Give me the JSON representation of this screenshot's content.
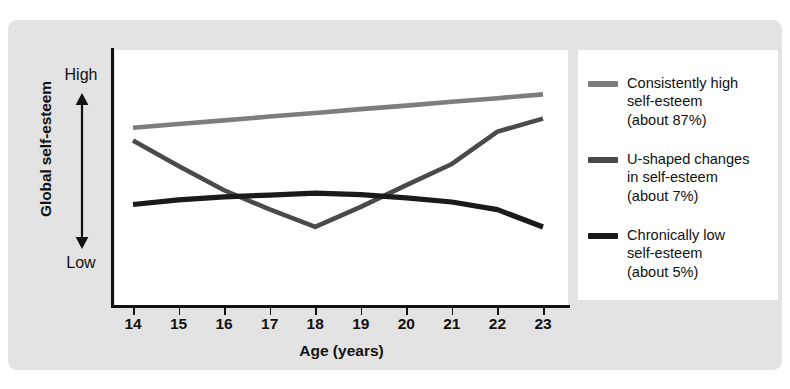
{
  "chart_data": {
    "type": "line",
    "title": "",
    "xlabel": "Age (years)",
    "ylabel": "Global self-esteem",
    "y_axis_top_label": "High",
    "y_axis_bottom_label": "Low",
    "grid": false,
    "legend_position": "right",
    "xlim": [
      14,
      23
    ],
    "ylim": [
      0,
      1
    ],
    "x": [
      14,
      15,
      16,
      17,
      18,
      19,
      20,
      21,
      22,
      23
    ],
    "categories": [
      "14",
      "15",
      "16",
      "17",
      "18",
      "19",
      "20",
      "21",
      "22",
      "23"
    ],
    "series": [
      {
        "name": "Consistently high self-esteem",
        "percent_label": "(about 87%)",
        "color": "#7d7d7d",
        "values": [
          0.695,
          0.71,
          0.724,
          0.739,
          0.753,
          0.768,
          0.782,
          0.797,
          0.811,
          0.826
        ]
      },
      {
        "name": "U-shaped changes in self-esteem",
        "percent_label": "(about 7%)",
        "color": "#4a4a4a",
        "values": [
          0.645,
          0.545,
          0.45,
          0.375,
          0.306,
          0.385,
          0.47,
          0.553,
          0.68,
          0.731
        ]
      },
      {
        "name": "Chronically low self-esteem",
        "percent_label": "(about 5%)",
        "color": "#1a1a1a",
        "values": [
          0.394,
          0.412,
          0.424,
          0.431,
          0.439,
          0.433,
          0.42,
          0.404,
          0.374,
          0.306
        ]
      }
    ]
  },
  "legend": {
    "items": [
      {
        "label": "Consistently high\nself-esteem\n(about 87%)",
        "color": "#7d7d7d"
      },
      {
        "label": "U-shaped changes\nin self-esteem\n(about 7%)",
        "color": "#4a4a4a"
      },
      {
        "label": "Chronically low\nself-esteem\n(about 5%)",
        "color": "#1a1a1a"
      }
    ]
  }
}
